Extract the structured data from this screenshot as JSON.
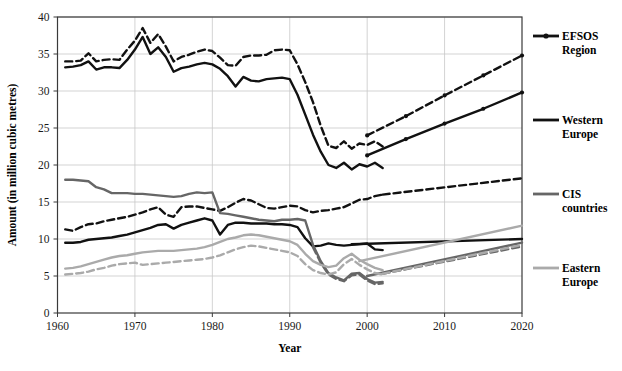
{
  "chart_data": {
    "type": "line",
    "title": "",
    "xlabel": "Year",
    "ylabel": "Amount (in million cubic metres)",
    "xlim": [
      1960,
      2020
    ],
    "ylim": [
      0,
      40
    ],
    "xticks": [
      1960,
      1970,
      1980,
      1990,
      2000,
      2010,
      2020
    ],
    "yticks": [
      0,
      5,
      10,
      15,
      20,
      25,
      30,
      35,
      40
    ],
    "grid": true,
    "legend_position": "right",
    "colors": {
      "efsos_region": "#111111",
      "western_europe": "#111111",
      "cis_countries": "#666666",
      "eastern_europe": "#aaaaaa",
      "grid": "#c8c8c8",
      "frame": "#3a3a3a"
    },
    "legend": [
      {
        "label_line1": "EFSOS",
        "label_line2": "Region",
        "key": "efsos_region",
        "style": "line-with-marker",
        "color": "#111111"
      },
      {
        "label_line1": "Western",
        "label_line2": "Europe",
        "key": "western_europe",
        "style": "thick-line",
        "color": "#111111"
      },
      {
        "label_line1": "CIS",
        "label_line2": "countries",
        "key": "cis_countries",
        "style": "thick-line",
        "color": "#666666"
      },
      {
        "label_line1": "Eastern",
        "label_line2": "Europe",
        "key": "eastern_europe",
        "style": "thick-line",
        "color": "#aaaaaa"
      }
    ],
    "series": [
      {
        "name": "EFSOS Region (solid)",
        "key": "efsos_region",
        "color": "#111111",
        "dash": "none",
        "width": 2.4,
        "x": [
          1961,
          1962,
          1963,
          1964,
          1965,
          1966,
          1967,
          1968,
          1969,
          1970,
          1971,
          1972,
          1973,
          1974,
          1975,
          1976,
          1977,
          1978,
          1979,
          1980,
          1981,
          1982,
          1983,
          1984,
          1985,
          1986,
          1987,
          1988,
          1989,
          1990,
          1991,
          1992,
          1993,
          1994,
          1995,
          1996,
          1997,
          1998,
          1999,
          2000,
          2001,
          2002
        ],
        "y": [
          33.2,
          33.3,
          33.5,
          34.0,
          32.9,
          33.2,
          33.2,
          33.1,
          34.2,
          35.6,
          37.3,
          35.0,
          35.9,
          34.6,
          32.6,
          33.1,
          33.3,
          33.6,
          33.8,
          33.6,
          33.0,
          32.0,
          30.6,
          31.9,
          31.4,
          31.3,
          31.6,
          31.7,
          31.8,
          31.6,
          29.5,
          26.8,
          24.1,
          21.8,
          20.0,
          19.6,
          20.3,
          19.4,
          20.1,
          19.8,
          20.3,
          19.6
        ]
      },
      {
        "name": "EFSOS Region (dashed)",
        "key": "efsos_region",
        "color": "#111111",
        "dash": "7,4",
        "width": 2.4,
        "x": [
          1961,
          1962,
          1963,
          1964,
          1965,
          1966,
          1967,
          1968,
          1969,
          1970,
          1971,
          1972,
          1973,
          1974,
          1975,
          1976,
          1977,
          1978,
          1979,
          1980,
          1981,
          1982,
          1983,
          1984,
          1985,
          1986,
          1987,
          1988,
          1989,
          1990,
          1991,
          1992,
          1993,
          1994,
          1995,
          1996,
          1997,
          1998,
          1999,
          2000,
          2001,
          2002
        ],
        "y": [
          34.0,
          34.0,
          34.1,
          35.1,
          34.0,
          34.2,
          34.3,
          34.2,
          35.6,
          36.8,
          38.5,
          36.5,
          37.7,
          36.0,
          34.0,
          34.6,
          34.9,
          35.3,
          35.6,
          35.4,
          34.5,
          33.5,
          33.4,
          34.6,
          34.8,
          34.8,
          34.9,
          35.5,
          35.6,
          35.5,
          33.6,
          31.2,
          28.5,
          25.3,
          22.6,
          22.3,
          23.2,
          22.2,
          22.9,
          22.7,
          23.2,
          22.5
        ]
      },
      {
        "name": "EFSOS Region projection (solid)",
        "key": "efsos_region",
        "color": "#111111",
        "dash": "none",
        "width": 2.4,
        "marker": true,
        "x": [
          2000,
          2005,
          2010,
          2015,
          2020
        ],
        "y": [
          21.3,
          23.5,
          25.6,
          27.6,
          29.8
        ]
      },
      {
        "name": "EFSOS Region projection (dashed)",
        "key": "efsos_region",
        "color": "#111111",
        "dash": "7,4",
        "width": 2.4,
        "marker": true,
        "x": [
          2000,
          2005,
          2010,
          2015,
          2020
        ],
        "y": [
          24.0,
          26.6,
          29.4,
          32.1,
          34.8
        ]
      },
      {
        "name": "Western Europe (solid)",
        "key": "western_europe",
        "color": "#111111",
        "dash": "none",
        "width": 2.4,
        "x": [
          1961,
          1962,
          1963,
          1964,
          1965,
          1966,
          1967,
          1968,
          1969,
          1970,
          1971,
          1972,
          1973,
          1974,
          1975,
          1976,
          1977,
          1978,
          1979,
          1980,
          1981,
          1982,
          1983,
          1984,
          1985,
          1986,
          1987,
          1988,
          1989,
          1990,
          1991,
          1992,
          1993,
          1994,
          1995,
          1996,
          1997,
          1998,
          1999,
          2000,
          2001,
          2002
        ],
        "y": [
          9.5,
          9.5,
          9.6,
          9.9,
          10.0,
          10.1,
          10.2,
          10.4,
          10.6,
          10.9,
          11.2,
          11.5,
          11.9,
          12.0,
          11.4,
          11.9,
          12.2,
          12.5,
          12.8,
          12.5,
          10.6,
          11.9,
          12.2,
          12.2,
          12.1,
          12.1,
          12.1,
          12.0,
          12.0,
          11.9,
          11.6,
          10.1,
          9.0,
          9.1,
          9.4,
          9.2,
          9.1,
          9.2,
          9.3,
          9.4,
          8.6,
          8.5
        ]
      },
      {
        "name": "Western Europe (dashed)",
        "key": "western_europe",
        "color": "#111111",
        "dash": "7,4",
        "width": 2.4,
        "x": [
          1961,
          1962,
          1963,
          1964,
          1965,
          1966,
          1967,
          1968,
          1969,
          1970,
          1971,
          1972,
          1973,
          1974,
          1975,
          1976,
          1977,
          1978,
          1979,
          1980,
          1981,
          1982,
          1983,
          1984,
          1985,
          1986,
          1987,
          1988,
          1989,
          1990,
          1991,
          1992,
          1993,
          1994,
          1995,
          1996,
          1997,
          1998,
          1999,
          2000,
          2001,
          2002
        ],
        "y": [
          11.3,
          11.1,
          11.6,
          12.0,
          12.1,
          12.4,
          12.6,
          12.8,
          13.0,
          13.3,
          13.6,
          14.0,
          14.3,
          13.3,
          13.0,
          14.3,
          14.4,
          14.4,
          14.2,
          14.0,
          13.8,
          14.3,
          14.9,
          15.4,
          15.2,
          14.7,
          14.2,
          14.1,
          14.3,
          14.5,
          14.4,
          13.9,
          13.6,
          13.8,
          13.9,
          14.1,
          14.3,
          14.8,
          15.3,
          15.4,
          15.8,
          16.0
        ]
      },
      {
        "name": "Western Europe projection (solid)",
        "key": "western_europe",
        "color": "#111111",
        "dash": "none",
        "width": 2.4,
        "x": [
          1998,
          2020
        ],
        "y": [
          9.3,
          10.0
        ]
      },
      {
        "name": "Western Europe projection (dashed)",
        "key": "western_europe",
        "color": "#111111",
        "dash": "7,4",
        "width": 2.4,
        "x": [
          2002,
          2020
        ],
        "y": [
          16.0,
          18.2
        ]
      },
      {
        "name": "CIS countries (solid)",
        "key": "cis_countries",
        "color": "#666666",
        "dash": "none",
        "width": 2.4,
        "x": [
          1961,
          1962,
          1963,
          1964,
          1965,
          1966,
          1967,
          1968,
          1969,
          1970,
          1971,
          1972,
          1973,
          1974,
          1975,
          1976,
          1977,
          1978,
          1979,
          1980,
          1981,
          1982,
          1983,
          1984,
          1985,
          1986,
          1987,
          1988,
          1989,
          1990,
          1991,
          1992,
          1993,
          1994,
          1995,
          1996,
          1997,
          1998,
          1999,
          2000,
          2001,
          2002
        ],
        "y": [
          18.0,
          18.0,
          17.9,
          17.8,
          17.0,
          16.7,
          16.2,
          16.2,
          16.2,
          16.1,
          16.1,
          16.0,
          15.9,
          15.8,
          15.7,
          15.8,
          16.1,
          16.3,
          16.2,
          16.3,
          13.5,
          13.4,
          13.2,
          13.0,
          12.8,
          12.6,
          12.5,
          12.4,
          12.6,
          12.6,
          12.7,
          12.5,
          9.2,
          7.0,
          5.4,
          4.8,
          4.4,
          5.3,
          5.4,
          4.6,
          4.1,
          4.2
        ]
      },
      {
        "name": "CIS countries (dashed)",
        "key": "cis_countries",
        "color": "#666666",
        "dash": "7,4",
        "width": 2.4,
        "x": [
          1993,
          1994,
          1995,
          1996,
          1997,
          1998,
          1999,
          2000,
          2001,
          2002
        ],
        "y": [
          8.9,
          6.8,
          5.2,
          4.6,
          4.3,
          5.1,
          5.2,
          4.4,
          3.9,
          4.0
        ]
      },
      {
        "name": "CIS countries projection (solid)",
        "key": "cis_countries",
        "color": "#666666",
        "dash": "none",
        "width": 2.4,
        "x": [
          2000,
          2020
        ],
        "y": [
          5.0,
          9.5
        ]
      },
      {
        "name": "CIS countries projection (dashed)",
        "key": "cis_countries",
        "color": "#666666",
        "dash": "7,4",
        "width": 2.4,
        "x": [
          2002,
          2020
        ],
        "y": [
          5.3,
          9.0
        ]
      },
      {
        "name": "Eastern Europe (solid)",
        "key": "eastern_europe",
        "color": "#aaaaaa",
        "dash": "none",
        "width": 2.4,
        "x": [
          1961,
          1962,
          1963,
          1964,
          1965,
          1966,
          1967,
          1968,
          1969,
          1970,
          1971,
          1972,
          1973,
          1974,
          1975,
          1976,
          1977,
          1978,
          1979,
          1980,
          1981,
          1982,
          1983,
          1984,
          1985,
          1986,
          1987,
          1988,
          1989,
          1990,
          1991,
          1992,
          1993,
          1994,
          1995,
          1996,
          1997,
          1998,
          1999,
          2000,
          2001,
          2002
        ],
        "y": [
          6.0,
          6.1,
          6.3,
          6.6,
          6.9,
          7.2,
          7.5,
          7.7,
          7.8,
          8.0,
          8.2,
          8.3,
          8.4,
          8.4,
          8.4,
          8.5,
          8.6,
          8.7,
          8.9,
          9.2,
          9.6,
          10.0,
          10.2,
          10.5,
          10.6,
          10.5,
          10.3,
          10.1,
          9.9,
          9.7,
          9.2,
          8.0,
          7.0,
          6.5,
          6.2,
          6.4,
          7.4,
          8.0,
          7.2,
          6.6,
          6.1,
          5.8
        ]
      },
      {
        "name": "Eastern Europe (dashed)",
        "key": "eastern_europe",
        "color": "#aaaaaa",
        "dash": "7,4",
        "width": 2.4,
        "x": [
          1961,
          1962,
          1963,
          1964,
          1965,
          1966,
          1967,
          1968,
          1969,
          1970,
          1971,
          1972,
          1973,
          1974,
          1975,
          1976,
          1977,
          1978,
          1979,
          1980,
          1981,
          1982,
          1983,
          1984,
          1985,
          1986,
          1987,
          1988,
          1989,
          1990,
          1991,
          1992,
          1993,
          1994,
          1995,
          1996,
          1997,
          1998,
          1999,
          2000,
          2001,
          2002
        ],
        "y": [
          5.2,
          5.3,
          5.4,
          5.6,
          5.9,
          6.1,
          6.4,
          6.6,
          6.7,
          6.8,
          6.5,
          6.6,
          6.7,
          6.8,
          6.9,
          7.0,
          7.1,
          7.2,
          7.3,
          7.5,
          7.8,
          8.2,
          8.6,
          8.9,
          9.1,
          9.0,
          8.8,
          8.6,
          8.4,
          8.2,
          7.7,
          6.6,
          5.8,
          5.4,
          5.2,
          5.5,
          6.6,
          7.3,
          6.5,
          5.9,
          5.4,
          5.2
        ]
      },
      {
        "name": "Eastern Europe projection (solid)",
        "key": "eastern_europe",
        "color": "#aaaaaa",
        "dash": "none",
        "width": 2.4,
        "x": [
          1999,
          2020
        ],
        "y": [
          7.0,
          11.8
        ]
      },
      {
        "name": "Eastern Europe projection (dashed)",
        "key": "eastern_europe",
        "color": "#aaaaaa",
        "dash": "7,4",
        "width": 2.4,
        "x": [
          2002,
          2020
        ],
        "y": [
          5.3,
          9.2
        ]
      }
    ]
  }
}
